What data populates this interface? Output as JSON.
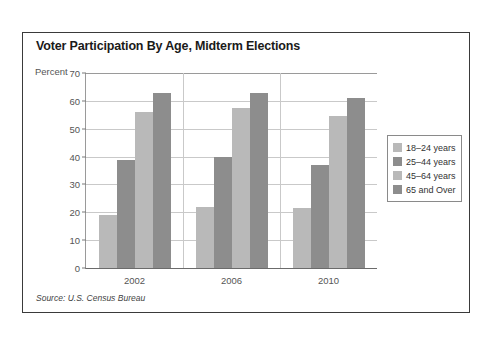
{
  "chart_data": {
    "type": "bar",
    "title": "Voter Participation By Age, Midterm Elections",
    "xlabel": "",
    "ylabel": "Percent",
    "categories": [
      "2002",
      "2006",
      "2010"
    ],
    "series": [
      {
        "name": "18–24 years",
        "color": "#b9b9b9",
        "values": [
          19.0,
          22.0,
          21.4
        ]
      },
      {
        "name": "25–44 years",
        "color": "#8d8d8d",
        "values": [
          38.8,
          40.0,
          37.0
        ]
      },
      {
        "name": "45–64 years",
        "color": "#b9b9b9",
        "values": [
          56.0,
          57.5,
          54.7
        ]
      },
      {
        "name": "65 and Over",
        "color": "#8d8d8d",
        "values": [
          62.8,
          62.8,
          61.0
        ]
      }
    ],
    "ylim": [
      0,
      70
    ],
    "yticks": [
      0,
      10,
      20,
      30,
      40,
      50,
      60,
      70
    ],
    "ytick_labels": [
      "0",
      "10",
      "20",
      "30",
      "40",
      "50",
      "60",
      "70"
    ],
    "grid": true,
    "legend_position": "right",
    "source": "Source: U.S. Census Bureau"
  },
  "legend": {
    "items": [
      {
        "label": "18–24 years",
        "color": "#b9b9b9"
      },
      {
        "label": "25–44 years",
        "color": "#8d8d8d"
      },
      {
        "label": "45–64 years",
        "color": "#b9b9b9"
      },
      {
        "label": "65 and Over",
        "color": "#8d8d8d"
      }
    ]
  }
}
